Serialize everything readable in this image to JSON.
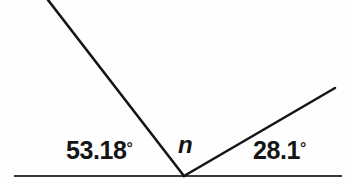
{
  "figure": {
    "kind": "angle-diagram",
    "background_color": "#fefefe",
    "stroke_color": "#151515",
    "text_color": "#151515",
    "width": 350,
    "height": 183
  },
  "labels": {
    "left_angle": "53.18",
    "left_angle_full": "53.18°",
    "unknown_angle": "n",
    "right_angle": "28.1",
    "right_angle_full": "28.1°",
    "degree_symbol": "°"
  },
  "geometry": {
    "vertex": {
      "x": 184,
      "y": 176
    },
    "baseline": {
      "x1": 14,
      "y1": 176,
      "x2": 342,
      "y2": 176,
      "width": 2
    },
    "left_ray": {
      "x1": 184,
      "y1": 176,
      "x2": 48,
      "y2": 0,
      "width": 2.6
    },
    "right_ray": {
      "x1": 184,
      "y1": 176,
      "x2": 335,
      "y2": 88,
      "width": 2.6
    }
  },
  "chart_data": {
    "type": "diagram",
    "title": "",
    "angles": [
      {
        "name": "left",
        "label": "53.18°",
        "value": 53.18,
        "unit": "degrees"
      },
      {
        "name": "middle",
        "label": "n",
        "value": null,
        "unit": "degrees"
      },
      {
        "name": "right",
        "label": "28.1°",
        "value": 28.1,
        "unit": "degrees"
      }
    ],
    "relationship": "53.18 + n + 28.1 = 180",
    "annotations": [
      "53.18°",
      "n",
      "28.1°"
    ]
  }
}
